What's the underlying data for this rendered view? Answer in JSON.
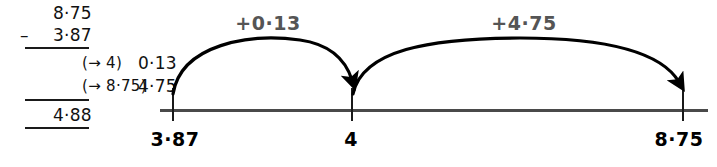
{
  "calculation": {
    "minuend": "8·75",
    "operator": "–",
    "subtrahend": "3·87",
    "difference": "0·13",
    "difference_note": "(→ 4)",
    "addend": "4·75",
    "addend_note": "(→ 8·75)",
    "total": "4·88"
  },
  "numberline": {
    "ticks": [
      {
        "label": "3·87",
        "x": 172
      },
      {
        "label": "4",
        "x": 351
      },
      {
        "label": "8·75",
        "x": 682
      }
    ],
    "jumps": [
      {
        "label": "+0·13",
        "x": 268,
        "y": 12
      },
      {
        "label": "+4·75",
        "x": 524,
        "y": 12
      }
    ],
    "axis_color": "#4a4a4a",
    "arc_color": "#000000",
    "jump_label_color": "#555555"
  }
}
